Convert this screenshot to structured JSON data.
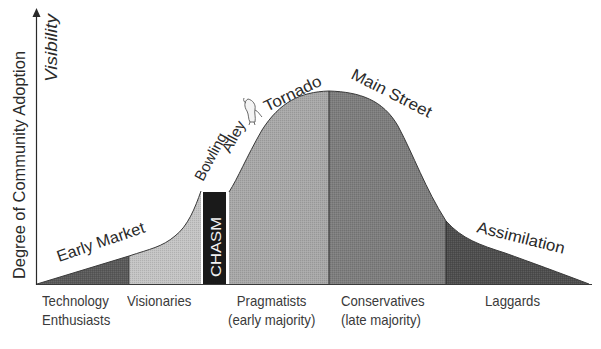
{
  "diagram": {
    "y_axis_label": "Degree of Community Adoption",
    "y_axis_sublabel": "Visibility",
    "curve_labels": {
      "early_market": "Early Market",
      "bowling_alley_line1": "Bowling",
      "bowling_alley_line2": "Alley",
      "tornado": "Tornado",
      "main_street": "Main Street",
      "assimilation": "Assimilation"
    },
    "chasm_label": "CHASM",
    "segments": [
      {
        "name": "Technology Enthusiasts",
        "line1": "Technology",
        "line2": "Enthusiasts",
        "color": "#5a5a5a"
      },
      {
        "name": "Visionaries",
        "line1": "Visionaries",
        "line2": "",
        "color": "#c4c4c4"
      },
      {
        "name": "Pragmatists",
        "line1": "Pragmatists",
        "line2": "(early majority)",
        "color": "#a8a8a8"
      },
      {
        "name": "Conservatives",
        "line1": "Conservatives",
        "line2": "(late majority)",
        "color": "#7e7e7e"
      },
      {
        "name": "Laggards",
        "line1": "Laggards",
        "line2": "",
        "color": "#4e4e4e"
      }
    ],
    "chasm_color": "#1a1a1a",
    "tornado_icon": "tornado-icon"
  }
}
